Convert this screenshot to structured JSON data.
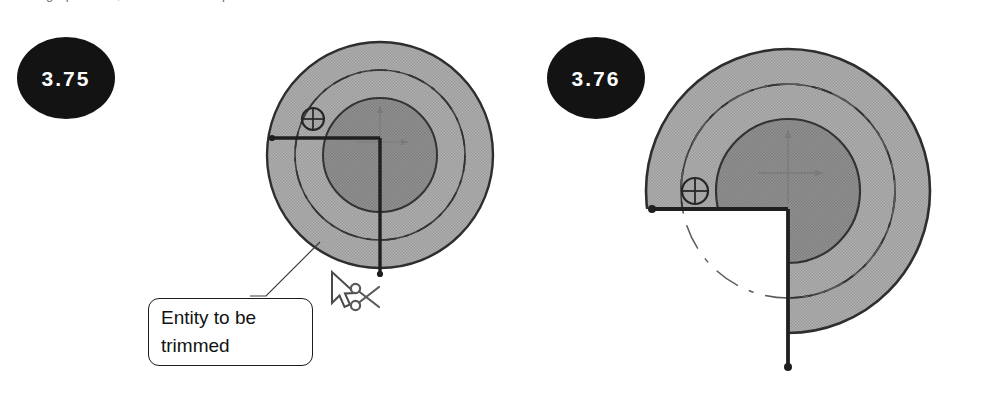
{
  "document": {
    "top_text_remnant": "trimming operation, as shown in steps",
    "background_color": "#ffffff"
  },
  "steps": [
    {
      "id": "step-before",
      "badge_label": "3.75",
      "badge_color": "#131313",
      "badge_text_color": "#ffffff",
      "caption": ""
    },
    {
      "id": "step-after",
      "badge_label": "3.76",
      "badge_color": "#131313",
      "badge_text_color": "#ffffff",
      "caption": ""
    }
  ],
  "callout": {
    "line1": "Entity to be",
    "line2": "trimmed",
    "text": "Entity to be trimmed",
    "border_color": "#1c1c1c",
    "fill_color": "#ffffff"
  },
  "cursor": {
    "pointer_icon": "mouse-pointer-icon",
    "tool_icon": "scissors-icon",
    "tool_name": "trim-tool"
  },
  "figures": {
    "before": {
      "name": "cad-sketch-before-trim",
      "description": "Concentric circles with dashed construction circle, crosshair point marker, and L-shaped trim boundary lines",
      "colors": {
        "outer_ring_fill": "#a9a9a9",
        "mid_ring_fill": "#a3a3a3",
        "inner_disc_fill": "#898989",
        "outline": "#2e2e2e",
        "construction_line": "#3a3a3a",
        "axis_marker": "#7a7a7a"
      },
      "geometry": {
        "center_x": 130,
        "center_y": 137,
        "outer_radius": 113,
        "mid_radius": 85,
        "inner_radius": 57,
        "dashed_radius": 85,
        "point_marker_x": 63,
        "point_marker_y": 101,
        "point_marker_radius": 11,
        "line_left_x": 22,
        "line_y": 120,
        "line_bottom_y": 256
      }
    },
    "after": {
      "name": "cad-sketch-after-trim",
      "description": "Same concentric circles with the lower-left quadrant trimmed away, leaving an open white notch bounded by the L-shaped lines",
      "colors": {
        "outer_ring_fill": "#a9a9a9",
        "mid_ring_fill": "#a3a3a3",
        "inner_disc_fill": "#898989",
        "outline": "#2e2e2e",
        "construction_line": "#3a3a3a",
        "axis_marker": "#7a7a7a",
        "trimmed_region": "#ffffff"
      },
      "geometry": {
        "center_x": 173,
        "center_y": 173,
        "outer_radius": 142,
        "mid_radius": 107,
        "inner_radius": 72,
        "dashed_radius": 107,
        "point_marker_x": 80,
        "point_marker_y": 173,
        "point_marker_radius": 13,
        "line_left_x": 37,
        "line_y": 191,
        "line_bottom_y": 349,
        "node_radius": 4
      }
    }
  }
}
